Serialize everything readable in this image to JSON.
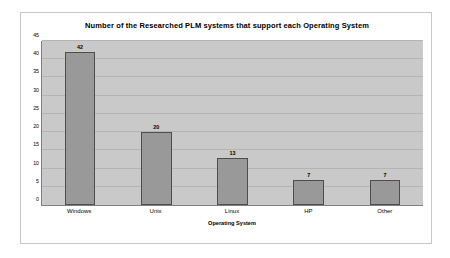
{
  "chart_data": {
    "type": "bar",
    "title": "Number of the Researched PLM systems that support each Operating System",
    "xlabel": "Operating System",
    "ylabel": "",
    "categories": [
      "Windows",
      "Unix",
      "Linux",
      "HP",
      "Other"
    ],
    "values": [
      42,
      20,
      13,
      7,
      7
    ],
    "ylim": [
      0,
      45
    ],
    "ytick_step": 5,
    "yticks": [
      0,
      5,
      10,
      15,
      20,
      25,
      30,
      35,
      40,
      45
    ],
    "grid": true,
    "legend": false,
    "data_labels": [
      "42",
      "20",
      "13",
      "7",
      "7"
    ],
    "colors": {
      "bar_fill": "#999999",
      "bar_border": "#4d4d4d",
      "plot_background": "#c9c9c9",
      "gridline": "#b4b4b4",
      "chart_background": "#ffffff",
      "axis_line": "#808080",
      "text": "#000000"
    }
  }
}
